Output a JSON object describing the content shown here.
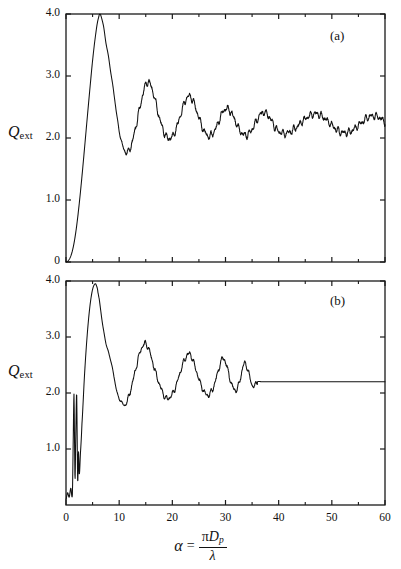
{
  "figure": {
    "panels": [
      {
        "tag": "(a)"
      },
      {
        "tag": "(b)"
      }
    ],
    "y_axis_label_symbol": "Q",
    "y_axis_label_subscript": "ext",
    "x_axis_formula": {
      "variable": "α",
      "equals": "=",
      "numerator_pi": "π",
      "numerator_d": "D",
      "numerator_sub": "p",
      "denominator": "λ"
    }
  },
  "chart_data": [
    {
      "type": "line",
      "panel": "(a)",
      "title": "",
      "xlabel": "α = πD_p/λ",
      "ylabel": "Q_ext",
      "xlim": [
        0,
        60
      ],
      "ylim": [
        0,
        4.0
      ],
      "grid": false,
      "legend": null,
      "annotations": [
        "(a)"
      ],
      "xticks": [
        0,
        10,
        20,
        30,
        40,
        50,
        60
      ],
      "xticklabels": [
        "0",
        "10",
        "20",
        "30",
        "40",
        "50",
        "60"
      ],
      "xminorticks": [
        5,
        15,
        25,
        35,
        45,
        55
      ],
      "yticks": [
        0,
        1.0,
        2.0,
        3.0,
        4.0
      ],
      "yticklabels": [
        "0",
        "1.0",
        "2.0",
        "3.0",
        "4.0"
      ],
      "description": "Mie extinction efficiency for non-absorbing sphere: smooth interference envelope with superimposed high-frequency ripple, damping toward 2.1",
      "x": [
        0.0,
        0.5,
        1.0,
        1.5,
        2.0,
        2.5,
        3.0,
        3.5,
        4.0,
        4.5,
        5.0,
        5.5,
        6.0,
        6.5,
        7.0,
        7.5,
        8.0,
        8.5,
        9.0,
        9.5,
        10.0,
        10.5,
        11.0,
        11.5,
        12.0,
        12.5,
        13.0,
        13.5,
        14.0,
        14.5,
        15.0,
        15.5,
        16.0,
        16.5,
        17.0,
        17.5,
        18.0,
        18.5,
        19.0,
        19.5,
        20.0,
        20.5,
        21.0,
        21.5,
        22.0,
        22.5,
        23.0,
        23.5,
        24.0,
        24.5,
        25.0,
        25.5,
        26.0,
        26.5,
        27.0,
        27.5,
        28.0,
        28.5,
        29.0,
        29.5,
        30.0,
        30.5,
        31.0,
        31.5,
        32.0,
        32.5,
        33.0,
        33.5,
        34.0,
        34.5,
        35.0,
        35.5,
        36.0,
        36.5,
        37.0,
        37.5,
        38.0,
        38.5,
        39.0,
        39.5,
        40.0,
        41.0,
        42.0,
        43.0,
        44.0,
        45.0,
        46.0,
        47.0,
        48.0,
        49.0,
        50.0,
        51.0,
        52.0,
        53.0,
        54.0,
        55.0,
        56.0,
        57.0,
        58.0,
        59.0,
        60.0
      ],
      "y": [
        0.0,
        0.03,
        0.12,
        0.3,
        0.58,
        0.95,
        1.38,
        1.85,
        2.33,
        2.8,
        3.25,
        3.62,
        3.9,
        3.99,
        3.82,
        3.55,
        3.3,
        3.02,
        2.72,
        2.4,
        2.12,
        1.92,
        1.8,
        1.76,
        1.82,
        1.95,
        2.13,
        2.33,
        2.53,
        2.72,
        2.86,
        2.9,
        2.84,
        2.7,
        2.52,
        2.35,
        2.2,
        2.08,
        2.01,
        1.99,
        2.02,
        2.1,
        2.22,
        2.36,
        2.5,
        2.61,
        2.67,
        2.66,
        2.58,
        2.46,
        2.33,
        2.2,
        2.11,
        2.05,
        2.03,
        2.06,
        2.13,
        2.22,
        2.33,
        2.42,
        2.47,
        2.47,
        2.42,
        2.34,
        2.24,
        2.15,
        2.09,
        2.05,
        2.05,
        2.08,
        2.14,
        2.22,
        2.3,
        2.37,
        2.41,
        2.41,
        2.37,
        2.3,
        2.22,
        2.15,
        2.1,
        2.07,
        2.09,
        2.15,
        2.23,
        2.31,
        2.37,
        2.39,
        2.36,
        2.29,
        2.21,
        2.13,
        2.09,
        2.09,
        2.13,
        2.2,
        2.28,
        2.34,
        2.36,
        2.33,
        2.26
      ]
    },
    {
      "type": "line",
      "panel": "(b)",
      "title": "",
      "xlabel": "α = πD_p/λ",
      "ylabel": "Q_ext",
      "xlim": [
        0,
        60
      ],
      "ylim": [
        0,
        4.0
      ],
      "grid": false,
      "legend": null,
      "annotations": [
        "(b)"
      ],
      "xticks": [
        0,
        10,
        20,
        30,
        40,
        50,
        60
      ],
      "xticklabels": [
        "0",
        "10",
        "20",
        "30",
        "40",
        "50",
        "60"
      ],
      "xminorticks": [
        5,
        15,
        25,
        35,
        45,
        55
      ],
      "yticks": [
        1.0,
        2.0,
        3.0,
        4.0
      ],
      "yticklabels": [
        "1.0",
        "2.0",
        "3.0",
        "4.0"
      ],
      "description": "Same extinction curve with sharp narrow resonance spikes near alpha 1.5-2.5, oscillations truncated near alpha 36 and held constant at 2.2 thereafter",
      "x": [
        0.0,
        0.3,
        0.6,
        0.9,
        1.2,
        1.35,
        1.5,
        1.6,
        1.7,
        1.85,
        2.0,
        2.1,
        2.2,
        2.35,
        2.5,
        2.7,
        3.0,
        3.5,
        4.0,
        4.5,
        5.0,
        5.5,
        5.8,
        6.0,
        6.5,
        7.0,
        7.5,
        8.0,
        8.5,
        9.0,
        9.5,
        10.0,
        10.5,
        11.0,
        11.5,
        12.0,
        12.5,
        13.0,
        13.5,
        14.0,
        14.5,
        15.0,
        15.5,
        16.0,
        16.5,
        17.0,
        17.5,
        18.0,
        18.5,
        19.0,
        19.5,
        20.0,
        20.5,
        21.0,
        21.5,
        22.0,
        22.5,
        23.0,
        23.5,
        24.0,
        24.5,
        25.0,
        25.5,
        26.0,
        26.5,
        27.0,
        27.5,
        28.0,
        28.5,
        29.0,
        29.5,
        30.0,
        30.5,
        31.0,
        31.5,
        32.0,
        32.5,
        33.0,
        33.5,
        34.0,
        34.5,
        35.0,
        35.5,
        36.0,
        37.0,
        40.0,
        45.0,
        50.0,
        55.0,
        60.0
      ],
      "y": [
        0.1,
        0.22,
        0.14,
        0.3,
        0.18,
        1.1,
        1.98,
        1.2,
        0.45,
        1.3,
        2.0,
        1.25,
        0.4,
        0.95,
        0.55,
        0.9,
        1.45,
        2.35,
        3.05,
        3.55,
        3.85,
        3.95,
        3.9,
        3.8,
        3.5,
        3.15,
        2.9,
        2.72,
        2.55,
        2.3,
        2.05,
        1.9,
        1.83,
        1.78,
        1.85,
        2.0,
        2.18,
        2.38,
        2.58,
        2.75,
        2.85,
        2.88,
        2.8,
        2.65,
        2.48,
        2.32,
        2.18,
        2.05,
        1.95,
        1.9,
        1.92,
        1.98,
        2.08,
        2.22,
        2.38,
        2.52,
        2.63,
        2.7,
        2.67,
        2.55,
        2.4,
        2.25,
        2.12,
        2.02,
        1.97,
        1.98,
        2.05,
        2.18,
        2.35,
        2.52,
        2.62,
        2.55,
        2.38,
        2.2,
        2.08,
        2.05,
        2.15,
        2.35,
        2.52,
        2.48,
        2.3,
        2.14,
        2.12,
        2.2,
        2.2,
        2.2,
        2.2,
        2.2,
        2.2,
        2.2
      ]
    }
  ]
}
